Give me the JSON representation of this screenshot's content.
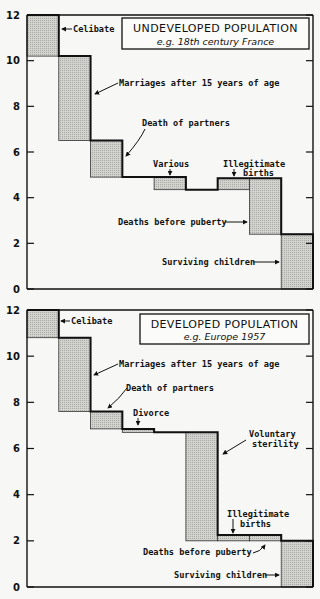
{
  "chart_data": [
    {
      "type": "bar",
      "subtype": "waterfall-step",
      "title": "UNDEVELOPED POPULATION",
      "subtitle": "e.g. 18th century France",
      "xlabel": "",
      "ylabel": "",
      "ylim": [
        0,
        12
      ],
      "yticks": [
        0,
        2,
        4,
        6,
        8,
        10,
        12
      ],
      "grid": false,
      "columns": 9,
      "steps": [
        {
          "label": "Celibate",
          "from": 12.0,
          "to": 10.2
        },
        {
          "label": "Marriages after 15 years of age",
          "from": 10.2,
          "to": 6.5
        },
        {
          "label": "Death of partners",
          "from": 6.5,
          "to": 4.9
        },
        {
          "label": "",
          "from": 4.9,
          "to": 4.9
        },
        {
          "label": "Various",
          "from": 4.9,
          "to": 4.35
        },
        {
          "label": "",
          "from": 4.35,
          "to": 4.35
        },
        {
          "label": "Illegitimate births",
          "from": 4.35,
          "to": 4.85
        },
        {
          "label": "Deaths before puberty",
          "from": 4.85,
          "to": 2.4
        },
        {
          "label": "Surviving children",
          "from": 2.4,
          "to": 0
        }
      ]
    },
    {
      "type": "bar",
      "subtype": "waterfall-step",
      "title": "DEVELOPED POPULATION",
      "subtitle": "e.g. Europe 1957",
      "xlabel": "",
      "ylabel": "",
      "ylim": [
        0,
        12
      ],
      "yticks": [
        0,
        2,
        4,
        6,
        8,
        10,
        12
      ],
      "grid": false,
      "columns": 9,
      "steps": [
        {
          "label": "Celibate",
          "from": 12.0,
          "to": 10.8
        },
        {
          "label": "Marriages after 15 years of age",
          "from": 10.8,
          "to": 7.6
        },
        {
          "label": "Death of partners",
          "from": 7.6,
          "to": 6.85
        },
        {
          "label": "Divorce",
          "from": 6.85,
          "to": 6.7
        },
        {
          "label": "",
          "from": 6.7,
          "to": 6.7
        },
        {
          "label": "Voluntary sterility",
          "from": 6.7,
          "to": 2.0
        },
        {
          "label": "Illegitimate births",
          "from": 2.0,
          "to": 2.25
        },
        {
          "label": "Deaths before puberty",
          "from": 2.25,
          "to": 2.0
        },
        {
          "label": "Surviving children",
          "from": 2.0,
          "to": 0
        }
      ]
    }
  ],
  "panels": [
    {
      "title": "UNDEVELOPED POPULATION",
      "subtitle": "e.g. 18th century France",
      "labels": {
        "celibate": "Celibate",
        "marriages": "Marriages after 15 years of age",
        "death_partners": "Death of partners",
        "various": "Various",
        "illegit_1": "Illegitimate",
        "illegit_2": "births",
        "deaths_puberty": "Deaths before puberty",
        "surviving": "Surviving children"
      },
      "ytick_labels": [
        "0",
        "2",
        "4",
        "6",
        "8",
        "10",
        "12"
      ]
    },
    {
      "title": "DEVELOPED POPULATION",
      "subtitle": "e.g. Europe 1957",
      "labels": {
        "celibate": "Celibate",
        "marriages": "Marriages after 15 years of age",
        "death_partners": "Death of partners",
        "divorce": "Divorce",
        "vol_1": "Voluntary",
        "vol_2": "sterility",
        "illegit_1": "Illegitimate",
        "illegit_2": "births",
        "deaths_puberty": "Deaths before puberty",
        "surviving": "Surviving children"
      },
      "ytick_labels": [
        "0",
        "2",
        "4",
        "6",
        "8",
        "10",
        "12"
      ]
    }
  ],
  "colors": {
    "bar_fill": "#c9c9c6",
    "line": "#111111",
    "background": "#f7f7f5"
  }
}
